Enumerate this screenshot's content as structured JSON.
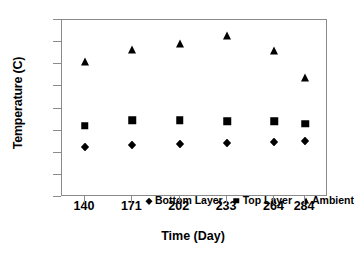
{
  "chart_data": {
    "type": "scatter",
    "title": "",
    "xlabel": "Time (Day)",
    "ylabel": "Temperature (C)",
    "categories": [
      "140",
      "171",
      "202",
      "233",
      "264",
      "284"
    ],
    "x": [
      140,
      171,
      202,
      233,
      264,
      284
    ],
    "xlim": [
      125,
      299
    ],
    "ylim": [
      0,
      40
    ],
    "yticks": [
      0,
      5,
      10,
      15,
      20,
      25,
      30,
      35,
      40
    ],
    "ytick_labels": [
      "0",
      "5",
      "10",
      "15",
      "20",
      "25",
      "30",
      "35",
      "40"
    ],
    "grid": false,
    "legend_position": "inside-bottom-center",
    "series": [
      {
        "name": "Bottom Layer",
        "marker": "diamond",
        "color": "#000000",
        "values": [
          11.4,
          11.8,
          12.0,
          12.3,
          12.5,
          12.7
        ]
      },
      {
        "name": "Top Layer",
        "marker": "square",
        "color": "#000000",
        "values": [
          16.1,
          17.4,
          17.4,
          17.1,
          17.1,
          16.5
        ]
      },
      {
        "name": "Ambient",
        "marker": "triangle",
        "color": "#000000",
        "values": [
          30.4,
          33.3,
          34.5,
          36.4,
          33.0,
          27.0
        ]
      }
    ]
  }
}
